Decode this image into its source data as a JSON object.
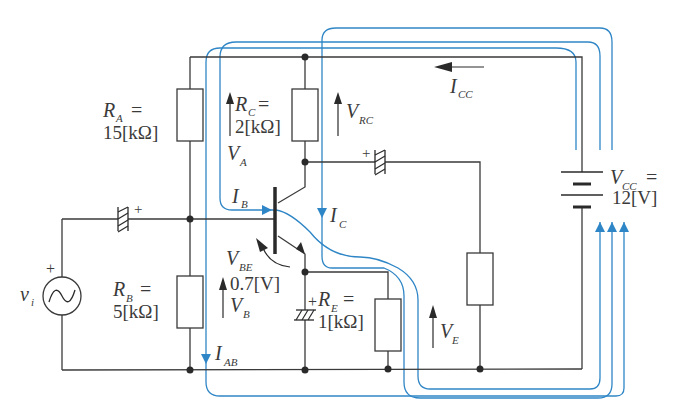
{
  "diagram": {
    "type": "transistor-bias-circuit",
    "colors": {
      "wire": "#3a3a3a",
      "current_path": "#2f86c6",
      "background": "#ffffff"
    },
    "components": {
      "RA": {
        "symbol": "R",
        "sub": "A",
        "eq": "=",
        "value": "15[kΩ]"
      },
      "RB": {
        "symbol": "R",
        "sub": "B",
        "eq": "=",
        "value": "5[kΩ]"
      },
      "RC": {
        "symbol": "R",
        "sub": "C",
        "eq": "=",
        "value": "2[kΩ]"
      },
      "RE": {
        "symbol": "R",
        "sub": "E",
        "eq": "=",
        "value": "1[kΩ]",
        "plus": "+"
      },
      "VCC": {
        "symbol": "V",
        "sub": "CC",
        "eq": "=",
        "value": "12[V]"
      },
      "vi": {
        "symbol": "v",
        "sub": "i",
        "plus": "+"
      },
      "cap_in": {
        "plus": "+"
      },
      "cap_out": {
        "plus": "+"
      }
    },
    "voltages": {
      "VA": {
        "symbol": "V",
        "sub": "A"
      },
      "VB": {
        "symbol": "V",
        "sub": "B"
      },
      "VBE": {
        "symbol": "V",
        "sub": "BE",
        "value": "0.7[V]"
      },
      "VRC": {
        "symbol": "V",
        "sub": "RC"
      },
      "VE": {
        "symbol": "V",
        "sub": "E"
      }
    },
    "currents": {
      "ICC": {
        "symbol": "I",
        "sub": "CC"
      },
      "IB": {
        "symbol": "I",
        "sub": "B"
      },
      "IC": {
        "symbol": "I",
        "sub": "C"
      },
      "IAB": {
        "symbol": "I",
        "sub": "AB"
      }
    }
  }
}
